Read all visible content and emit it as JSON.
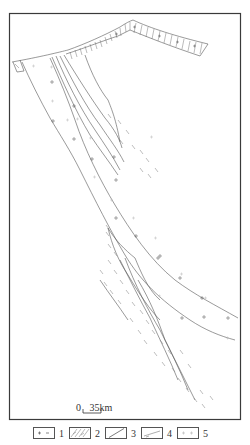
{
  "figure": {
    "type": "geological-map",
    "frame": {
      "left": 9,
      "top": 13,
      "right": 241,
      "bottom": 420
    },
    "colors": {
      "frame": "#3a3a3a",
      "lines": "#555555",
      "dash": "#888888",
      "light_plus": "#bbbbbb",
      "background": "#ffffff"
    }
  },
  "scale_bar": {
    "zero": "0",
    "distance": "35km"
  },
  "legend": {
    "items": [
      {
        "number": "1",
        "symbol": "plus-minus-icon"
      },
      {
        "number": "2",
        "symbol": "hatch-icon"
      },
      {
        "number": "3",
        "symbol": "diagonal-line-icon"
      },
      {
        "number": "4",
        "symbol": "dashed-diagonal-icon"
      },
      {
        "number": "5",
        "symbol": "light-plus-icon"
      }
    ]
  }
}
